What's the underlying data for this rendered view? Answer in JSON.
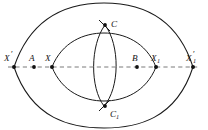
{
  "figure": {
    "kind": "geometric-construction-diagram",
    "background_color": "#ffffff",
    "stroke_color": "#1a1a1a",
    "axis_color": "#6b6b6b",
    "width": 208,
    "height": 130,
    "axis": {
      "name": "horizontal-dashed-axis",
      "style": "dashed",
      "y": 67,
      "x_start": 8,
      "x_end": 200
    },
    "points": [
      {
        "id": "X-prime",
        "base": "X",
        "prime": "′",
        "sub": "",
        "x": 14,
        "y": 67,
        "label_x": 6,
        "label_y": 60,
        "marked": true
      },
      {
        "id": "A",
        "base": "A",
        "prime": "",
        "sub": "",
        "x": 34,
        "y": 67,
        "label_x": 29,
        "label_y": 60,
        "marked": true
      },
      {
        "id": "X",
        "base": "X",
        "prime": "",
        "sub": "",
        "x": 52,
        "y": 67,
        "label_x": 46,
        "label_y": 60,
        "marked": true
      },
      {
        "id": "C",
        "base": "C",
        "prime": "",
        "sub": "",
        "x": 105,
        "y": 25,
        "label_x": 111,
        "label_y": 24,
        "marked": true
      },
      {
        "id": "C-one",
        "base": "C",
        "prime": "",
        "sub": "1",
        "x": 105,
        "y": 106,
        "label_x": 110,
        "label_y": 116,
        "marked": true
      },
      {
        "id": "B",
        "base": "B",
        "prime": "",
        "sub": "",
        "x": 137,
        "y": 67,
        "label_x": 132,
        "label_y": 60,
        "marked": true
      },
      {
        "id": "X-one",
        "base": "X",
        "prime": "",
        "sub": "1",
        "x": 156,
        "y": 67,
        "label_x": 152,
        "label_y": 60,
        "marked": true
      },
      {
        "id": "X-prime-one",
        "base": "X",
        "prime": "′",
        "sub": "1",
        "x": 193,
        "y": 67,
        "label_x": 188,
        "label_y": 60,
        "marked": true
      }
    ],
    "curves": [
      {
        "id": "outer-lens-upper",
        "name": "outer-arc-upper",
        "d": "M 14 67 C 32 14, 72 3, 104 3 C 136 3, 176 14, 193 67"
      },
      {
        "id": "outer-lens-lower",
        "name": "outer-arc-lower",
        "d": "M 14 67 C 32 120, 72 128, 104 128 C 136 128, 176 120, 193 67"
      },
      {
        "id": "inner-lens-upper",
        "name": "inner-arc-upper",
        "d": "M 52 67 C 62 42, 84 33, 104 33 C 124 33, 146 42, 156 67"
      },
      {
        "id": "inner-lens-lower",
        "name": "inner-arc-lower",
        "d": "M 52 67 C 62 92, 84 101, 104 101 C 124 101, 146 92, 156 67"
      },
      {
        "id": "vertical-lens-left",
        "name": "vertical-arc-left",
        "d": "M 105 25 C 90 45, 90 88, 104 106"
      },
      {
        "id": "vertical-lens-right",
        "name": "vertical-arc-right",
        "d": "M 105 25 C 120 45, 120 88, 104 106"
      },
      {
        "id": "cusp-tick-top",
        "name": "cusp-crossing-top",
        "d": "M 99 20 L 110 31"
      },
      {
        "id": "cusp-tick-bottom",
        "name": "cusp-crossing-bottom",
        "d": "M 99 111 L 110 100"
      }
    ],
    "labels": {
      "x_prime": "X",
      "a": "A",
      "x": "X",
      "c": "C",
      "c_one": "C",
      "b": "B",
      "x_one": "X",
      "x_prime_one": "X",
      "prime_mark": "′",
      "sub_one": "1"
    }
  }
}
